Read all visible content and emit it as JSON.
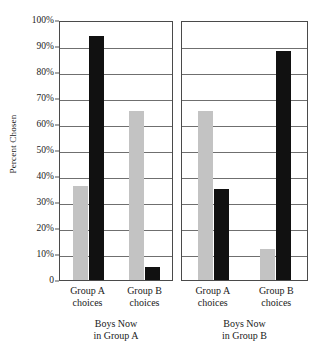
{
  "chart_data": {
    "type": "bar",
    "title": "",
    "xlabel": "",
    "ylabel": "Percent Chosen",
    "ylim": [
      0,
      100
    ],
    "ytick_labels": [
      "100%",
      "90%",
      "80%",
      "70%",
      "60%",
      "50%",
      "40%",
      "30%",
      "20%",
      "10%",
      "0"
    ],
    "ytick_values": [
      100,
      90,
      80,
      70,
      60,
      50,
      40,
      30,
      20,
      10,
      0
    ],
    "grid": true,
    "legend_position": "inside-upper-center-left-panel",
    "legend": [
      {
        "name": "Phase 1",
        "color": "#c3c3c3"
      },
      {
        "name": "Phase 2",
        "color": "#111111"
      }
    ],
    "categories": [
      "Group A choices",
      "Group B choices"
    ],
    "panels": [
      {
        "caption": "Boys Now in Group A",
        "caption_line1": "Boys Now",
        "caption_line2": "in Group A",
        "categories": [
          {
            "line1": "Group A",
            "line2": "choices"
          },
          {
            "line1": "Group B",
            "line2": "choices"
          }
        ],
        "series": [
          {
            "name": "Phase 1",
            "values": [
              36,
              65
            ]
          },
          {
            "name": "Phase 2",
            "values": [
              94,
              5
            ]
          }
        ]
      },
      {
        "caption": "Boys Now in Group B",
        "caption_line1": "Boys Now",
        "caption_line2": "in Group B",
        "categories": [
          {
            "line1": "Group A",
            "line2": "choices"
          },
          {
            "line1": "Group B",
            "line2": "choices"
          }
        ],
        "series": [
          {
            "name": "Phase 1",
            "values": [
              65,
              12
            ]
          },
          {
            "name": "Phase 2",
            "values": [
              35,
              88
            ]
          }
        ]
      }
    ]
  }
}
